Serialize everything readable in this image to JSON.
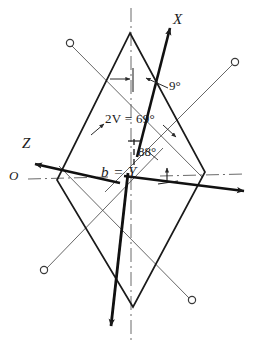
{
  "figure": {
    "background_color": "#ffffff",
    "ink_color": "#1a1a1a",
    "thin_line_color": "#4a4a4a",
    "width": 255,
    "height": 350
  },
  "labels": {
    "axis_x": "X",
    "axis_z": "Z",
    "origin": "O",
    "center": "b = Y",
    "angle_top": "9°",
    "angle_2v": "2V = 69°",
    "angle_mid": "88°"
  },
  "annotations": {
    "two_v_prefix": "2V",
    "two_v_value": "= 69°"
  },
  "geometry": {
    "rhombus": {
      "top_apex": [
        130,
        33
      ],
      "right_vertex": [
        205,
        172
      ],
      "bottom_apex": [
        133,
        307
      ],
      "left_vertex": [
        57,
        180
      ]
    },
    "vertical_axis": {
      "x": 131,
      "y_top": 8,
      "y_bottom": 344,
      "style": "dash-dot"
    },
    "horizontal_axis": {
      "y": 178,
      "x_left": 28,
      "x_right": 245,
      "style": "dash-dot"
    },
    "vector_x": {
      "from": [
        137,
        155
      ],
      "to": [
        172,
        25
      ],
      "label": "X"
    },
    "vector_z": {
      "from": [
        118,
        182
      ],
      "to": [
        33,
        163
      ],
      "label": "Z"
    },
    "vector_right": {
      "from": [
        124,
        176
      ],
      "to": [
        246,
        191
      ]
    },
    "vector_down": {
      "from": [
        128,
        172
      ],
      "to": [
        110,
        328
      ]
    },
    "circles": [
      {
        "cx": 70,
        "cy": 43,
        "r": 4
      },
      {
        "cx": 235,
        "cy": 62,
        "r": 4
      },
      {
        "cx": 44,
        "cy": 270,
        "r": 4
      },
      {
        "cx": 192,
        "cy": 300,
        "r": 4
      }
    ],
    "thin_guides": [
      {
        "from": [
          70,
          43
        ],
        "to": [
          200,
          175
        ]
      },
      {
        "from": [
          235,
          62
        ],
        "to": [
          110,
          190
        ]
      },
      {
        "from": [
          44,
          270
        ],
        "to": [
          160,
          150
        ]
      },
      {
        "from": [
          192,
          300
        ],
        "to": [
          62,
          168
        ]
      }
    ]
  }
}
